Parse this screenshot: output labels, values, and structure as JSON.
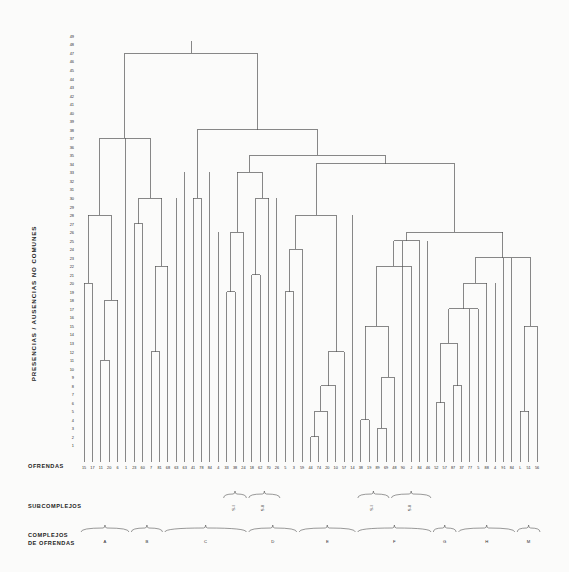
{
  "figure": {
    "type": "dendrogram",
    "language": "es",
    "background": "#fbfbfa",
    "line_color": "#555555"
  },
  "labels": {
    "y_axis_title": "PRESENCIAS / AUSENCIAS  NO  COMUNES",
    "leaf_axis_title": "OFRENDAS",
    "subcomplex_row_title": "SUBCOMPLEJOS",
    "complex_row_title_line1": "COMPLEJOS",
    "complex_row_title_line2": "DE  OFRENDAS"
  },
  "chart_data": {
    "type": "dendrogram",
    "title": "",
    "xlabel": "OFRENDAS",
    "ylabel": "PRESENCIAS / AUSENCIAS NO COMUNES",
    "ylim": [
      0,
      49
    ],
    "grid": false,
    "legend": "none",
    "y_ticks": [
      1,
      2,
      3,
      4,
      5,
      6,
      7,
      8,
      9,
      10,
      11,
      12,
      13,
      14,
      15,
      16,
      17,
      18,
      19,
      20,
      21,
      22,
      23,
      24,
      25,
      26,
      27,
      28,
      29,
      30,
      31,
      32,
      33,
      34,
      35,
      36,
      37,
      38,
      39,
      40,
      41,
      42,
      43,
      44,
      45,
      46,
      47,
      48,
      49
    ],
    "leaf_labels": [
      "15",
      "17",
      "11",
      "20",
      "6",
      "1",
      "23",
      "60",
      "7",
      "81",
      "68",
      "63",
      "63",
      "41",
      "78",
      "84",
      "4",
      "33",
      "38",
      "24",
      "18",
      "62",
      "70",
      "26",
      "5",
      "3",
      "59",
      "44",
      "74",
      "20",
      "10",
      "57",
      "14",
      "38",
      "19",
      "89",
      "69",
      "48",
      "90",
      "J",
      "84",
      "46",
      "52",
      "57",
      "87",
      "37",
      "77",
      "5",
      "88",
      "4",
      "91",
      "84",
      "L",
      "51",
      "56"
    ],
    "subcomplex_brackets": [
      {
        "label": "S-I",
        "leaf_from": 17,
        "leaf_to": 19
      },
      {
        "label": "S-II",
        "leaf_from": 20,
        "leaf_to": 23
      },
      {
        "label": "S-I",
        "leaf_from": 33,
        "leaf_to": 36
      },
      {
        "label": "S-II",
        "leaf_from": 37,
        "leaf_to": 41
      }
    ],
    "complex_brackets": [
      {
        "label": "A",
        "leaf_from": 0,
        "leaf_to": 5
      },
      {
        "label": "B",
        "leaf_from": 6,
        "leaf_to": 9
      },
      {
        "label": "C",
        "leaf_from": 10,
        "leaf_to": 19
      },
      {
        "label": "D",
        "leaf_from": 20,
        "leaf_to": 25
      },
      {
        "label": "E",
        "leaf_from": 26,
        "leaf_to": 32
      },
      {
        "label": "F",
        "leaf_from": 33,
        "leaf_to": 41
      },
      {
        "label": "G",
        "leaf_from": 42,
        "leaf_to": 44
      },
      {
        "label": "H",
        "leaf_from": 45,
        "leaf_to": 51
      },
      {
        "label": "M",
        "leaf_from": 52,
        "leaf_to": 54
      }
    ],
    "merges": [
      {
        "id": "m01",
        "left": {
          "leaf": 0
        },
        "right": {
          "leaf": 1
        },
        "height": 20
      },
      {
        "id": "m02",
        "left": {
          "leaf": 2
        },
        "right": {
          "leaf": 3
        },
        "height": 11
      },
      {
        "id": "m03",
        "left": {
          "node": "m02"
        },
        "right": {
          "leaf": 4
        },
        "height": 18
      },
      {
        "id": "m04",
        "left": {
          "node": "m01"
        },
        "right": {
          "node": "m03"
        },
        "height": 28
      },
      {
        "id": "m05",
        "left": {
          "leaf": 6
        },
        "right": {
          "leaf": 7
        },
        "height": 27
      },
      {
        "id": "m06",
        "left": {
          "leaf": 8
        },
        "right": {
          "leaf": 9
        },
        "height": 12
      },
      {
        "id": "m07",
        "left": {
          "node": "m06"
        },
        "right": {
          "leaf": 10
        },
        "height": 22
      },
      {
        "id": "m08",
        "left": {
          "node": "m05"
        },
        "right": {
          "node": "m07"
        },
        "height": 30
      },
      {
        "id": "m09",
        "left": {
          "node": "m04"
        },
        "right": {
          "node": "m08"
        },
        "height": 37
      },
      {
        "id": "m10",
        "left": {
          "leaf": 13
        },
        "right": {
          "leaf": 14
        },
        "height": 30
      },
      {
        "id": "m11",
        "left": {
          "leaf": 17
        },
        "right": {
          "leaf": 18
        },
        "height": 19
      },
      {
        "id": "m12",
        "left": {
          "node": "m11"
        },
        "right": {
          "leaf": 19
        },
        "height": 26
      },
      {
        "id": "m13",
        "left": {
          "leaf": 20
        },
        "right": {
          "leaf": 21
        },
        "height": 21
      },
      {
        "id": "m14",
        "left": {
          "node": "m13"
        },
        "right": {
          "leaf": 22
        },
        "height": 30
      },
      {
        "id": "m15",
        "left": {
          "leaf": 24
        },
        "right": {
          "leaf": 25
        },
        "height": 19
      },
      {
        "id": "m16",
        "left": {
          "node": "m15"
        },
        "right": {
          "leaf": 26
        },
        "height": 24
      },
      {
        "id": "m17",
        "left": {
          "leaf": 27
        },
        "right": {
          "leaf": 28
        },
        "height": 2
      },
      {
        "id": "m18",
        "left": {
          "node": "m17"
        },
        "right": {
          "leaf": 29
        },
        "height": 5
      },
      {
        "id": "m19",
        "left": {
          "node": "m18"
        },
        "right": {
          "leaf": 30
        },
        "height": 8
      },
      {
        "id": "m20",
        "left": {
          "node": "m19"
        },
        "right": {
          "leaf": 31
        },
        "height": 12
      },
      {
        "id": "m21",
        "left": {
          "node": "m16"
        },
        "right": {
          "node": "m20"
        },
        "height": 28
      },
      {
        "id": "m22",
        "left": {
          "leaf": 33
        },
        "right": {
          "leaf": 34
        },
        "height": 4
      },
      {
        "id": "m23",
        "left": {
          "leaf": 35
        },
        "right": {
          "leaf": 36
        },
        "height": 3
      },
      {
        "id": "m24",
        "left": {
          "node": "m23"
        },
        "right": {
          "leaf": 37
        },
        "height": 9
      },
      {
        "id": "m25",
        "left": {
          "node": "m22"
        },
        "right": {
          "node": "m24"
        },
        "height": 15
      },
      {
        "id": "m26",
        "left": {
          "node": "m25"
        },
        "right": {
          "leaf": 39
        },
        "height": 22
      },
      {
        "id": "m27",
        "left": {
          "node": "m26"
        },
        "right": {
          "leaf": 40
        },
        "height": 25
      },
      {
        "id": "m28",
        "left": {
          "leaf": 42
        },
        "right": {
          "leaf": 43
        },
        "height": 6
      },
      {
        "id": "m29",
        "left": {
          "leaf": 44
        },
        "right": {
          "leaf": 45
        },
        "height": 8
      },
      {
        "id": "m30",
        "left": {
          "node": "m28"
        },
        "right": {
          "node": "m29"
        },
        "height": 13
      },
      {
        "id": "m31",
        "left": {
          "node": "m30"
        },
        "right": {
          "leaf": 47
        },
        "height": 17
      },
      {
        "id": "m32",
        "left": {
          "node": "m31"
        },
        "right": {
          "leaf": 48
        },
        "height": 20
      },
      {
        "id": "m33",
        "left": {
          "leaf": 52
        },
        "right": {
          "leaf": 53
        },
        "height": 5
      },
      {
        "id": "m34",
        "left": {
          "node": "m33"
        },
        "right": {
          "leaf": 54
        },
        "height": 15
      },
      {
        "id": "m35",
        "left": {
          "node": "m32"
        },
        "right": {
          "node": "m34"
        },
        "height": 23
      },
      {
        "id": "m36",
        "left": {
          "node": "m27"
        },
        "right": {
          "node": "m35"
        },
        "height": 26
      },
      {
        "id": "m37",
        "left": {
          "node": "m21"
        },
        "right": {
          "node": "m36"
        },
        "height": 34
      },
      {
        "id": "m38",
        "left": {
          "node": "m12"
        },
        "right": {
          "node": "m14"
        },
        "height": 33
      },
      {
        "id": "m39",
        "left": {
          "node": "m38"
        },
        "right": {
          "node": "m37"
        },
        "height": 35
      },
      {
        "id": "m40",
        "left": {
          "node": "m10"
        },
        "right": {
          "node": "m39"
        },
        "height": 38
      },
      {
        "id": "m41",
        "left": {
          "node": "m09"
        },
        "right": {
          "node": "m40"
        },
        "height": 47
      }
    ]
  }
}
